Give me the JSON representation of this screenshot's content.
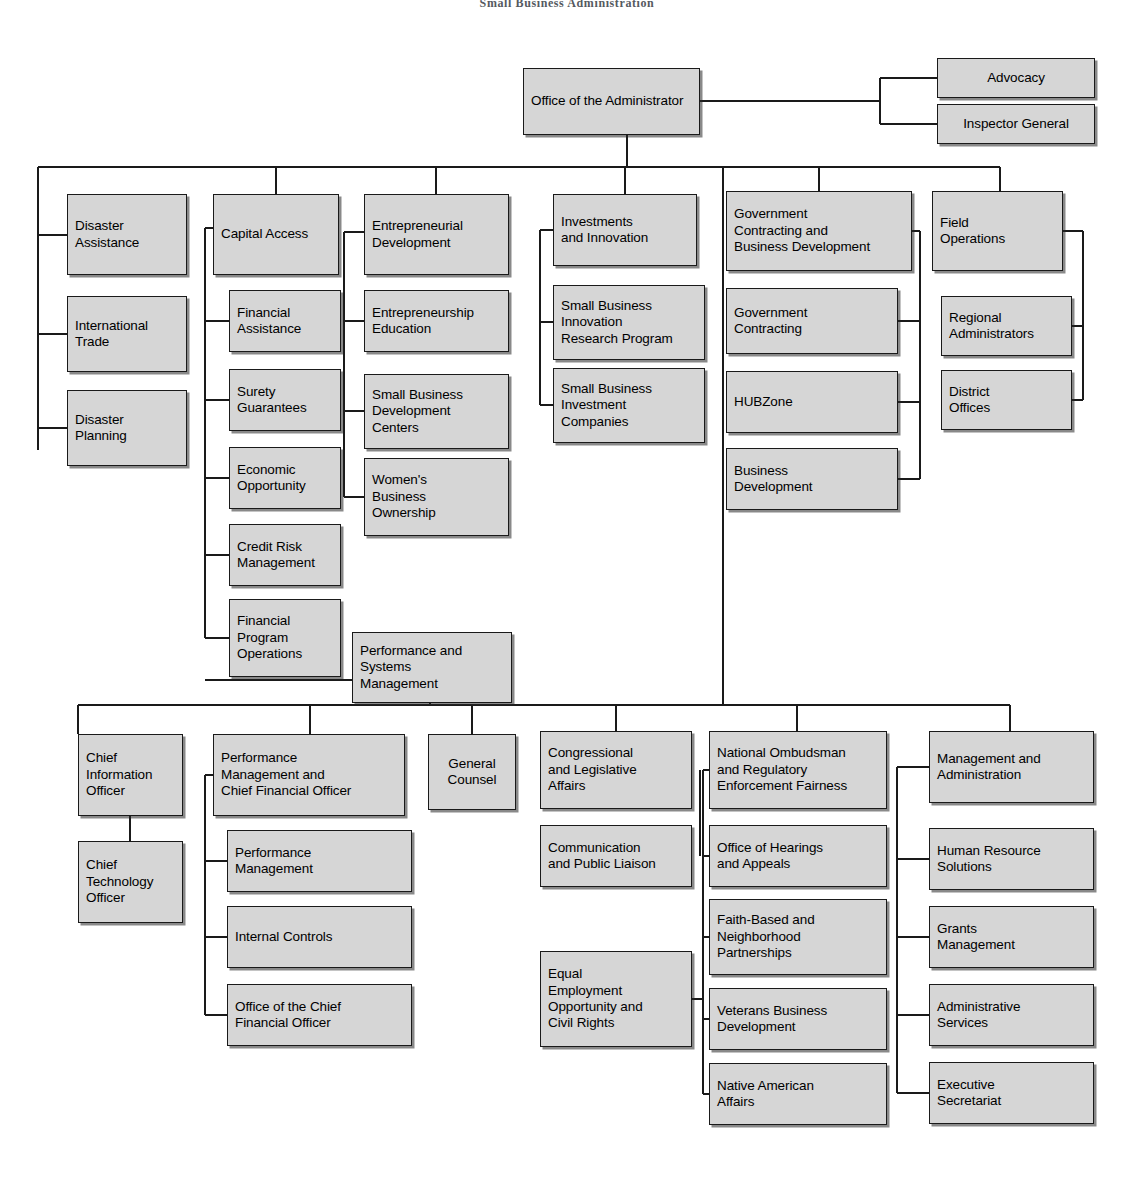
{
  "chart_title": "Small Business Administration",
  "colors": {
    "node_fill": "#d6d6d6",
    "node_border": "#1a1a1a",
    "connector": "#1a1a1a",
    "background": "#ffffff"
  },
  "chart_data": {
    "type": "diagram",
    "diagram_kind": "organization-chart",
    "title": "Small Business Administration",
    "root": "Office of the Administrator",
    "nodes": [
      {
        "id": "office-of-the-administrator",
        "label": "Office of the Administrator",
        "x": 523,
        "y": 68,
        "w": 177,
        "h": 67,
        "align": "left",
        "level": "root"
      },
      {
        "id": "advocacy",
        "label": "Advocacy",
        "x": 937,
        "y": 58,
        "w": 158,
        "h": 40,
        "align": "center",
        "level": "independent"
      },
      {
        "id": "inspector-general",
        "label": "Inspector General",
        "x": 937,
        "y": 104,
        "w": 158,
        "h": 40,
        "align": "center",
        "level": "independent"
      },
      {
        "id": "disaster-assistance",
        "label": "Disaster\nAssistance",
        "x": 67,
        "y": 194,
        "w": 120,
        "h": 81,
        "align": "left",
        "level": "division"
      },
      {
        "id": "international-trade",
        "label": "International\nTrade",
        "x": 67,
        "y": 296,
        "w": 120,
        "h": 76,
        "align": "left",
        "level": "program"
      },
      {
        "id": "disaster-planning",
        "label": "Disaster\nPlanning",
        "x": 67,
        "y": 390,
        "w": 120,
        "h": 76,
        "align": "left",
        "level": "program"
      },
      {
        "id": "capital-access",
        "label": "Capital Access",
        "x": 213,
        "y": 194,
        "w": 126,
        "h": 81,
        "align": "left",
        "level": "division"
      },
      {
        "id": "financial-assistance",
        "label": "Financial\nAssistance",
        "x": 229,
        "y": 290,
        "w": 112,
        "h": 62,
        "align": "left",
        "level": "program"
      },
      {
        "id": "surety-guarantees",
        "label": "Surety\nGuarantees",
        "x": 229,
        "y": 369,
        "w": 112,
        "h": 62,
        "align": "left",
        "level": "program"
      },
      {
        "id": "economic-opportunity",
        "label": "Economic\nOpportunity",
        "x": 229,
        "y": 447,
        "w": 112,
        "h": 62,
        "align": "left",
        "level": "program"
      },
      {
        "id": "credit-risk-management",
        "label": "Credit Risk\nManagement",
        "x": 229,
        "y": 524,
        "w": 112,
        "h": 62,
        "align": "left",
        "level": "program"
      },
      {
        "id": "financial-program-operations",
        "label": "Financial\nProgram\nOperations",
        "x": 229,
        "y": 599,
        "w": 112,
        "h": 78,
        "align": "left",
        "level": "program"
      },
      {
        "id": "entrepreneurial-development",
        "label": "Entrepreneurial\nDevelopment",
        "x": 364,
        "y": 194,
        "w": 145,
        "h": 81,
        "align": "left",
        "level": "division"
      },
      {
        "id": "entrepreneurship-education",
        "label": "Entrepreneurship\nEducation",
        "x": 364,
        "y": 290,
        "w": 145,
        "h": 62,
        "align": "left",
        "level": "program"
      },
      {
        "id": "small-business-development-centers",
        "label": "Small Business\nDevelopment\nCenters",
        "x": 364,
        "y": 374,
        "w": 145,
        "h": 75,
        "align": "left",
        "level": "program"
      },
      {
        "id": "womens-business-ownership",
        "label": "Women's\nBusiness\nOwnership",
        "x": 364,
        "y": 458,
        "w": 145,
        "h": 78,
        "align": "left",
        "level": "program"
      },
      {
        "id": "investments-and-innovation",
        "label": "Investments\nand Innovation",
        "x": 553,
        "y": 194,
        "w": 144,
        "h": 72,
        "align": "left",
        "level": "division"
      },
      {
        "id": "small-business-innovation-research-program",
        "label": "Small Business\nInnovation\nResearch Program",
        "x": 553,
        "y": 285,
        "w": 152,
        "h": 75,
        "align": "left",
        "level": "program"
      },
      {
        "id": "small-business-investment-companies",
        "label": "Small Business\nInvestment\nCompanies",
        "x": 553,
        "y": 368,
        "w": 152,
        "h": 75,
        "align": "left",
        "level": "program"
      },
      {
        "id": "government-contracting-and-business-development",
        "label": "Government\nContracting and\nBusiness Development",
        "x": 726,
        "y": 191,
        "w": 186,
        "h": 80,
        "align": "left",
        "level": "division"
      },
      {
        "id": "government-contracting",
        "label": "Government\nContracting",
        "x": 726,
        "y": 288,
        "w": 172,
        "h": 66,
        "align": "left",
        "level": "program"
      },
      {
        "id": "hubzone",
        "label": "HUBZone",
        "x": 726,
        "y": 371,
        "w": 172,
        "h": 62,
        "align": "left",
        "level": "program"
      },
      {
        "id": "business-development",
        "label": "Business\nDevelopment",
        "x": 726,
        "y": 448,
        "w": 172,
        "h": 62,
        "align": "left",
        "level": "program"
      },
      {
        "id": "field-operations",
        "label": "Field\nOperations",
        "x": 932,
        "y": 191,
        "w": 131,
        "h": 80,
        "align": "left",
        "level": "division"
      },
      {
        "id": "regional-administrators",
        "label": "Regional\nAdministrators",
        "x": 941,
        "y": 296,
        "w": 131,
        "h": 60,
        "align": "left",
        "level": "program"
      },
      {
        "id": "district-offices",
        "label": "District\nOffices",
        "x": 941,
        "y": 370,
        "w": 131,
        "h": 60,
        "align": "left",
        "level": "program"
      },
      {
        "id": "performance-and-systems-management",
        "label": "Performance and\nSystems\nManagement",
        "x": 352,
        "y": 632,
        "w": 160,
        "h": 71,
        "align": "left",
        "level": "division"
      },
      {
        "id": "chief-information-officer",
        "label": "Chief\nInformation\nOfficer",
        "x": 78,
        "y": 734,
        "w": 105,
        "h": 82,
        "align": "left",
        "level": "division"
      },
      {
        "id": "chief-technology-officer",
        "label": "Chief\nTechnology\nOfficer",
        "x": 78,
        "y": 841,
        "w": 105,
        "h": 82,
        "align": "left",
        "level": "program"
      },
      {
        "id": "performance-management-and-chief-financial-officer",
        "label": "Performance\nManagement and\nChief Financial Officer",
        "x": 213,
        "y": 734,
        "w": 192,
        "h": 82,
        "align": "left",
        "level": "division"
      },
      {
        "id": "performance-management",
        "label": "Performance\nManagement",
        "x": 227,
        "y": 830,
        "w": 185,
        "h": 62,
        "align": "left",
        "level": "program"
      },
      {
        "id": "internal-controls",
        "label": "Internal Controls",
        "x": 227,
        "y": 906,
        "w": 185,
        "h": 62,
        "align": "left",
        "level": "program"
      },
      {
        "id": "office-of-the-chief-financial-officer",
        "label": "Office of the Chief\nFinancial Officer",
        "x": 227,
        "y": 984,
        "w": 185,
        "h": 62,
        "align": "left",
        "level": "program"
      },
      {
        "id": "general-counsel",
        "label": "General\nCounsel",
        "x": 428,
        "y": 734,
        "w": 88,
        "h": 76,
        "align": "center",
        "level": "division"
      },
      {
        "id": "congressional-and-legislative-affairs",
        "label": "Congressional\nand Legislative\nAffairs",
        "x": 540,
        "y": 731,
        "w": 152,
        "h": 78,
        "align": "left",
        "level": "division"
      },
      {
        "id": "communication-and-public-liaison",
        "label": "Communication\nand Public Liaison",
        "x": 540,
        "y": 825,
        "w": 152,
        "h": 62,
        "align": "left",
        "level": "division"
      },
      {
        "id": "equal-employment-opportunity-and-civil-rights",
        "label": "Equal\nEmployment\nOpportunity and\nCivil Rights",
        "x": 540,
        "y": 951,
        "w": 152,
        "h": 96,
        "align": "left",
        "level": "division"
      },
      {
        "id": "national-ombudsman-and-regulatory-enforcement-fairness",
        "label": "National Ombudsman\nand Regulatory\nEnforcement Fairness",
        "x": 709,
        "y": 731,
        "w": 178,
        "h": 78,
        "align": "left",
        "level": "division"
      },
      {
        "id": "office-of-hearings-and-appeals",
        "label": "Office of Hearings\nand Appeals",
        "x": 709,
        "y": 825,
        "w": 178,
        "h": 62,
        "align": "left",
        "level": "division"
      },
      {
        "id": "faith-based-and-neighborhood-partnerships",
        "label": "Faith-Based and\nNeighborhood\nPartnerships",
        "x": 709,
        "y": 899,
        "w": 178,
        "h": 76,
        "align": "left",
        "level": "division"
      },
      {
        "id": "veterans-business-development",
        "label": "Veterans Business\nDevelopment",
        "x": 709,
        "y": 988,
        "w": 178,
        "h": 62,
        "align": "left",
        "level": "division"
      },
      {
        "id": "native-american-affairs",
        "label": "Native  American\nAffairs",
        "x": 709,
        "y": 1063,
        "w": 178,
        "h": 62,
        "align": "left",
        "level": "division"
      },
      {
        "id": "management-and-administration",
        "label": "Management and\nAdministration",
        "x": 929,
        "y": 731,
        "w": 165,
        "h": 72,
        "align": "left",
        "level": "division"
      },
      {
        "id": "human-resource-solutions",
        "label": "Human Resource\nSolutions",
        "x": 929,
        "y": 828,
        "w": 165,
        "h": 62,
        "align": "left",
        "level": "program"
      },
      {
        "id": "grants-management",
        "label": "Grants\nManagement",
        "x": 929,
        "y": 906,
        "w": 165,
        "h": 62,
        "align": "left",
        "level": "program"
      },
      {
        "id": "administrative-services",
        "label": "Administrative\nServices",
        "x": 929,
        "y": 984,
        "w": 165,
        "h": 62,
        "align": "left",
        "level": "program"
      },
      {
        "id": "executive-secretariat",
        "label": "Executive\nSecretariat",
        "x": 929,
        "y": 1062,
        "w": 165,
        "h": 62,
        "align": "left",
        "level": "program"
      }
    ],
    "connectors": [
      {
        "id": "root-to-independents-stub",
        "points": "700,101 880,101"
      },
      {
        "id": "independents-spine",
        "points": "880,78 880,124"
      },
      {
        "id": "advocacy-link",
        "points": "880,78 937,78"
      },
      {
        "id": "inspector-general-link",
        "points": "880,124 937,124"
      },
      {
        "id": "root-drop-to-main-bus",
        "points": "627,135 627,167"
      },
      {
        "id": "main-bus",
        "points": "38,167 1000,167"
      },
      {
        "id": "stem-disaster-col",
        "points": "38,167 38,450"
      },
      {
        "id": "stem-capital",
        "points": "276,167 276,194"
      },
      {
        "id": "stem-entdev",
        "points": "436,167 436,194"
      },
      {
        "id": "stem-investments",
        "points": "625,167 625,194"
      },
      {
        "id": "stem-govcon",
        "points": "819,167 819,191"
      },
      {
        "id": "stem-field",
        "points": "1000,167 1000,191"
      },
      {
        "id": "trunk-to-lower-bus",
        "points": "723,167 723,705"
      },
      {
        "id": "disaster-assistance-link",
        "points": "38,235 67,235"
      },
      {
        "id": "international-trade-link",
        "points": "38,334 67,334"
      },
      {
        "id": "disaster-planning-link",
        "points": "38,428 67,428"
      },
      {
        "id": "capital-spine",
        "points": "205,228 205,638"
      },
      {
        "id": "capital-access-link",
        "points": "205,228 213,228"
      },
      {
        "id": "financial-assistance-link",
        "points": "205,321 229,321"
      },
      {
        "id": "surety-guarantees-link",
        "points": "205,400 229,400"
      },
      {
        "id": "economic-opportunity-link",
        "points": "205,478 229,478"
      },
      {
        "id": "credit-risk-link",
        "points": "205,555 229,555"
      },
      {
        "id": "financial-program-ops-link",
        "points": "205,638 229,638"
      },
      {
        "id": "capital-spine-to-psm",
        "points": "205,680 352,680"
      },
      {
        "id": "entdev-spine",
        "points": "344,232 344,497"
      },
      {
        "id": "entrepreneurial-development-link",
        "points": "344,232 364,232"
      },
      {
        "id": "entrepreneurship-education-link",
        "points": "344,321 364,321"
      },
      {
        "id": "sbdc-link",
        "points": "344,411 364,411"
      },
      {
        "id": "wbo-link",
        "points": "344,497 364,497"
      },
      {
        "id": "investments-spine",
        "points": "540,230 540,405"
      },
      {
        "id": "investments-and-innovation-link",
        "points": "540,230 553,230"
      },
      {
        "id": "sbir-link",
        "points": "540,322 553,322"
      },
      {
        "id": "sbic-link",
        "points": "540,405 553,405"
      },
      {
        "id": "govcon-spine",
        "points": "920,231 920,479"
      },
      {
        "id": "govcon-head-link",
        "points": "912,231 920,231"
      },
      {
        "id": "government-contracting-link",
        "points": "898,321 920,321"
      },
      {
        "id": "hubzone-link",
        "points": "898,402 920,402"
      },
      {
        "id": "business-development-link",
        "points": "898,479 920,479"
      },
      {
        "id": "field-spine",
        "points": "1083,231 1083,400"
      },
      {
        "id": "field-operations-link",
        "points": "1063,231 1083,231"
      },
      {
        "id": "regional-administrators-link",
        "points": "1072,326 1083,326"
      },
      {
        "id": "district-offices-link",
        "points": "1072,400 1083,400"
      },
      {
        "id": "psm-drop",
        "points": "430,703 430,705"
      },
      {
        "id": "lower-bus",
        "points": "78,705 1010,705"
      },
      {
        "id": "stem-cio",
        "points": "78,705 78,734"
      },
      {
        "id": "stem-pmcfo",
        "points": "310,705 310,734"
      },
      {
        "id": "stem-general-counsel",
        "points": "472,705 472,734"
      },
      {
        "id": "stem-congressional",
        "points": "616,705 616,731"
      },
      {
        "id": "stem-ombudsman",
        "points": "797,705 797,731"
      },
      {
        "id": "stem-management",
        "points": "1010,705 1010,731"
      },
      {
        "id": "cio-to-cto",
        "points": "130,816 130,841"
      },
      {
        "id": "pmcfo-spine",
        "points": "205,775 205,1015"
      },
      {
        "id": "pmcfo-head-link",
        "points": "205,775 213,775"
      },
      {
        "id": "performance-management-link",
        "points": "205,861 227,861"
      },
      {
        "id": "internal-controls-link",
        "points": "205,937 227,937"
      },
      {
        "id": "ocfo-link",
        "points": "205,1015 227,1015"
      },
      {
        "id": "ombudsman-spine",
        "points": "703,770 703,1094"
      },
      {
        "id": "ombudsman-head-link",
        "points": "703,770 709,770"
      },
      {
        "id": "office-of-hearings-link",
        "points": "703,856 709,856"
      },
      {
        "id": "faith-based-link",
        "points": "703,937 709,937"
      },
      {
        "id": "veterans-business-link",
        "points": "703,1019 709,1019"
      },
      {
        "id": "native-american-link",
        "points": "703,1094 709,1094"
      },
      {
        "id": "eeo-to-ombudsman-spine",
        "points": "692,999 703,999"
      },
      {
        "id": "congressional-spine",
        "points": "700,770 700,856"
      },
      {
        "id": "management-spine",
        "points": "897,767 897,1093"
      },
      {
        "id": "management-head-link",
        "points": "897,767 929,767"
      },
      {
        "id": "human-resource-link",
        "points": "897,859 929,859"
      },
      {
        "id": "grants-management-link",
        "points": "897,937 929,937"
      },
      {
        "id": "administrative-services-link",
        "points": "897,1015 929,1015"
      },
      {
        "id": "executive-secretariat-link",
        "points": "897,1093 929,1093"
      }
    ]
  }
}
